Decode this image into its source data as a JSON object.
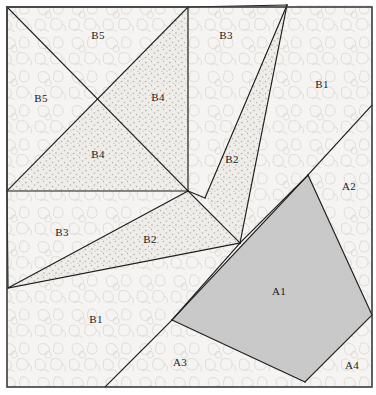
{
  "figure": {
    "canvas": {
      "width": 376,
      "height": 395
    },
    "frame": {
      "x": 7,
      "y": 7,
      "width": 365,
      "height": 380,
      "stroke": "#3a3a3a"
    },
    "inner_square": {
      "x": 7,
      "y": 7,
      "width": 181,
      "height": 184
    },
    "palette": {
      "background_fill": "#f7f5f3",
      "mottle_fill": "#f3f1ef",
      "mottle_stroke": "#dedbd6",
      "stipple_fill": "#eceae7",
      "stipple_dot": "#b9b5ae",
      "solid_gray": "#c9c9c9",
      "light_gray": "#e2e2e0",
      "edge_stroke": "#1d1d1d",
      "label_color": "#1a1a1a"
    },
    "regions": [
      {
        "id": "A1",
        "label": "A1",
        "fill_style": "solid-gray",
        "label_x": 279,
        "label_y": 292,
        "points": "308,175 372,315 305,382 172,320"
      },
      {
        "id": "A2",
        "label": "A2",
        "fill_style": "mottle",
        "label_x": 349,
        "label_y": 187,
        "points": "308,175 372,105 372,315"
      },
      {
        "id": "A3",
        "label": "A3",
        "fill_style": "mottle",
        "label_x": 180,
        "label_y": 363,
        "points": "172,320 305,382 105,387"
      },
      {
        "id": "A4",
        "label": "A4",
        "fill_style": "mottle",
        "label_x": 352,
        "label_y": 366,
        "points": "372,315 372,387 305,382"
      },
      {
        "id": "B1",
        "label": "B1",
        "fill_style": "mottle",
        "label_x": 322,
        "label_y": 85,
        "points": "287,5 372,5 372,105 308,175 240,243 296,5"
      },
      {
        "id": "B1b",
        "label": "B1",
        "fill_style": "mottle",
        "label_x": 96,
        "label_y": 320,
        "points": "8,288 240,243 172,320 105,387 8,387"
      },
      {
        "id": "B2",
        "label": "B2",
        "fill_style": "stipple",
        "label_x": 232,
        "label_y": 160,
        "points": "287,5 240,243 205,198"
      },
      {
        "id": "B2b",
        "label": "B2",
        "fill_style": "stipple",
        "label_x": 150,
        "label_y": 240,
        "points": "240,243 188,191 8,288"
      },
      {
        "id": "B3",
        "label": "B3",
        "fill_style": "mottle",
        "label_x": 226,
        "label_y": 36,
        "points": "188,7 287,5 205,198 188,191"
      },
      {
        "id": "B3b",
        "label": "B3",
        "fill_style": "mottle",
        "label_x": 62,
        "label_y": 233,
        "points": "8,191 188,191 8,288"
      },
      {
        "id": "B4",
        "label": "B4",
        "fill_style": "stipple",
        "label_x": 158,
        "label_y": 98,
        "points": "188,7 188,191 97,99"
      },
      {
        "id": "B4b",
        "label": "B4",
        "fill_style": "stipple",
        "label_x": 98,
        "label_y": 155,
        "points": "97,99 188,191 7,191"
      },
      {
        "id": "B5",
        "label": "B5",
        "fill_style": "mottle",
        "label_x": 98,
        "label_y": 36,
        "points": "7,7 188,7 97,99"
      },
      {
        "id": "B5b",
        "label": "B5",
        "fill_style": "mottle",
        "label_x": 41,
        "label_y": 99,
        "points": "7,7 97,99 7,191"
      }
    ],
    "edges": [
      "M 7,7 L 188,7 L 188,191 L 7,191 Z",
      "M 7,7 L 188,191",
      "M 188,7 L 7,191",
      "M 188,7 L 287,5",
      "M 287,5 L 205,198",
      "M 287,5 L 240,243",
      "M 205,198 L 188,191",
      "M 188,191 L 240,243",
      "M 8,288 L 188,191",
      "M 8,288 L 240,243",
      "M 7,191 L 8,288",
      "M 240,243 L 308,175",
      "M 308,175 L 372,105",
      "M 308,175 L 372,315",
      "M 308,175 L 172,320",
      "M 172,320 L 305,382",
      "M 305,382 L 372,315",
      "M 172,320 L 240,243",
      "M 172,320 L 105,387"
    ]
  }
}
